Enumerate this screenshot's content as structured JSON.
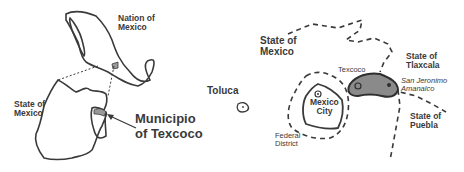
{
  "left_map": {
    "nation_label": "Nation of Mexico",
    "nation_label_line1": "Nation of",
    "nation_label_line2": "Mexico",
    "state_label_line1": "State of",
    "state_label_line2": "Mexico",
    "callout_line1": "Municipio",
    "callout_line2": "of Texcoco"
  },
  "right_map": {
    "state_of_mexico_line1": "State of",
    "state_of_mexico_line2": "Mexico",
    "toluca": "Toluca",
    "mexico_city_line1": "Mexico",
    "mexico_city_line2": "City",
    "federal_district_line1": "Federal",
    "federal_district_line2": "District",
    "texcoco": "Texcoco",
    "tlaxcala_line1": "State of",
    "tlaxcala_line2": "Tlaxcala",
    "san_jeronimo_line1": "San Jeronimo",
    "san_jeronimo_line2": "Amanalco",
    "puebla_line1": "State of",
    "puebla_line2": "Puebla"
  },
  "colors": {
    "outline": "#3a3a3a",
    "texcoco_fill": "#8a8a8a",
    "background": "#ffffff"
  }
}
